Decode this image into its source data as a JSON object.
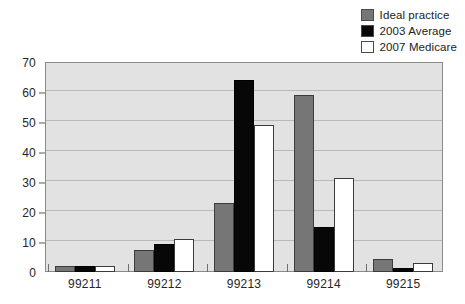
{
  "chart_data": {
    "type": "bar",
    "title": "",
    "subtitle": "",
    "xlabel": "",
    "ylabel": "",
    "categories": [
      "99211",
      "99212",
      "99213",
      "99214",
      "99215"
    ],
    "series": [
      {
        "name": "Ideal practice",
        "color": "#767676",
        "values": [
          2,
          7.5,
          23,
          59,
          4.5
        ]
      },
      {
        "name": "2003 Average",
        "color": "#070707",
        "values": [
          2,
          9.5,
          64,
          15,
          1.5
        ]
      },
      {
        "name": "2007 Medicare",
        "color": "#ffffff",
        "values": [
          2,
          11,
          49,
          31.5,
          3
        ]
      }
    ],
    "ylim": [
      0,
      70
    ],
    "yticks": [
      0,
      10,
      20,
      30,
      40,
      50,
      60,
      70
    ],
    "ytick_labels": [
      "0",
      "10",
      "20",
      "30",
      "40",
      "50",
      "60",
      "70"
    ],
    "grid": true,
    "grid_axis": "y",
    "legend_position": "top-right",
    "plot_background": "#e2e2e2"
  },
  "legend": {
    "items": [
      {
        "label": "Ideal practice",
        "swatch": "#767676"
      },
      {
        "label": "2003 Average",
        "swatch": "#070707"
      },
      {
        "label": "2007 Medicare",
        "swatch": "#ffffff"
      }
    ]
  }
}
